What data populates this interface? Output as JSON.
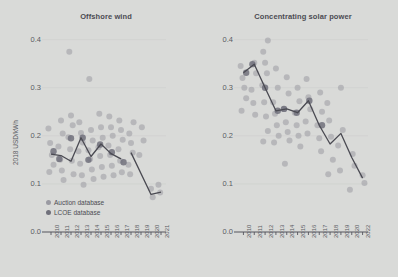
{
  "figure": {
    "background_color": "#d9dad8",
    "y_axis_label": "2018 USD/kWh",
    "y_ticks": [
      "0.0",
      "0.1",
      "0.2",
      "0.3",
      "0.4"
    ],
    "y_tick_values": [
      0.0,
      0.1,
      0.2,
      0.3,
      0.4
    ],
    "text_color": "#5a5a63",
    "line_color": "#4a4a52",
    "auction_color": "#9a9aa2",
    "lcoe_color": "#70707b"
  },
  "legend": {
    "position": "bottom-left-of-first-panel",
    "items": [
      {
        "label": "Auction database",
        "color": "#9a9aa2",
        "name": "auction"
      },
      {
        "label": "LCOE database",
        "color": "#70707b",
        "name": "lcoe"
      }
    ]
  },
  "chart_data": [
    {
      "type": "scatter",
      "title": "Offshore wind",
      "xlabel": "",
      "ylabel": "2018 USD/kWh",
      "ylim": [
        0.0,
        0.42
      ],
      "grid": false,
      "categories": [
        "2010",
        "2011",
        "2012",
        "2013",
        "2014",
        "2015",
        "2016",
        "2017",
        "2018",
        "2019",
        "2020",
        "2021"
      ],
      "line_label": "Weighted average",
      "line_series": {
        "name": "Weighted average",
        "x": [
          "2010",
          "2011",
          "2012",
          "2013",
          "2014",
          "2015",
          "2016",
          "2017"
        ],
        "values": [
          0.162,
          0.159,
          0.147,
          0.196,
          0.157,
          0.183,
          0.163,
          0.152
        ]
      },
      "line_series_2": {
        "name": "Weighted average (auction)",
        "x": [
          "2018",
          "2020",
          "2021"
        ],
        "values": [
          0.165,
          0.078,
          0.083
        ]
      },
      "series": [
        {
          "name": "Auction database",
          "color": "#9a9aa2",
          "points": [
            {
              "x": "2010",
              "y": 0.215
            },
            {
              "x": "2010",
              "y": 0.185
            },
            {
              "x": "2010",
              "y": 0.16
            },
            {
              "x": "2010",
              "y": 0.14
            },
            {
              "x": "2010",
              "y": 0.125
            },
            {
              "x": "2011",
              "y": 0.232
            },
            {
              "x": "2011",
              "y": 0.205
            },
            {
              "x": "2011",
              "y": 0.178
            },
            {
              "x": "2011",
              "y": 0.15
            },
            {
              "x": "2011",
              "y": 0.128
            },
            {
              "x": "2011",
              "y": 0.108
            },
            {
              "x": "2012",
              "y": 0.375
            },
            {
              "x": "2012",
              "y": 0.242
            },
            {
              "x": "2012",
              "y": 0.222
            },
            {
              "x": "2012",
              "y": 0.197
            },
            {
              "x": "2012",
              "y": 0.172
            },
            {
              "x": "2012",
              "y": 0.148
            },
            {
              "x": "2012",
              "y": 0.12
            },
            {
              "x": "2013",
              "y": 0.228
            },
            {
              "x": "2013",
              "y": 0.206
            },
            {
              "x": "2013",
              "y": 0.186
            },
            {
              "x": "2013",
              "y": 0.168
            },
            {
              "x": "2013",
              "y": 0.142
            },
            {
              "x": "2013",
              "y": 0.118
            },
            {
              "x": "2013",
              "y": 0.098
            },
            {
              "x": "2014",
              "y": 0.318
            },
            {
              "x": "2014",
              "y": 0.212
            },
            {
              "x": "2014",
              "y": 0.19
            },
            {
              "x": "2014",
              "y": 0.17
            },
            {
              "x": "2014",
              "y": 0.152
            },
            {
              "x": "2014",
              "y": 0.13
            },
            {
              "x": "2014",
              "y": 0.11
            },
            {
              "x": "2015",
              "y": 0.246
            },
            {
              "x": "2015",
              "y": 0.218
            },
            {
              "x": "2015",
              "y": 0.196
            },
            {
              "x": "2015",
              "y": 0.176
            },
            {
              "x": "2015",
              "y": 0.158
            },
            {
              "x": "2015",
              "y": 0.135
            },
            {
              "x": "2015",
              "y": 0.115
            },
            {
              "x": "2016",
              "y": 0.24
            },
            {
              "x": "2016",
              "y": 0.218
            },
            {
              "x": "2016",
              "y": 0.2
            },
            {
              "x": "2016",
              "y": 0.18
            },
            {
              "x": "2016",
              "y": 0.16
            },
            {
              "x": "2016",
              "y": 0.138
            },
            {
              "x": "2016",
              "y": 0.118
            },
            {
              "x": "2017",
              "y": 0.232
            },
            {
              "x": "2017",
              "y": 0.212
            },
            {
              "x": "2017",
              "y": 0.192
            },
            {
              "x": "2017",
              "y": 0.172
            },
            {
              "x": "2017",
              "y": 0.148
            },
            {
              "x": "2017",
              "y": 0.124
            },
            {
              "x": "2018",
              "y": 0.228
            },
            {
              "x": "2018",
              "y": 0.205
            },
            {
              "x": "2018",
              "y": 0.185
            },
            {
              "x": "2018",
              "y": 0.165
            },
            {
              "x": "2018",
              "y": 0.14
            },
            {
              "x": "2018",
              "y": 0.12
            },
            {
              "x": "2019",
              "y": 0.218
            },
            {
              "x": "2019",
              "y": 0.19
            },
            {
              "x": "2019",
              "y": 0.16
            },
            {
              "x": "2020",
              "y": 0.09
            },
            {
              "x": "2020",
              "y": 0.072
            },
            {
              "x": "2021",
              "y": 0.098
            },
            {
              "x": "2021",
              "y": 0.082
            }
          ]
        },
        {
          "name": "LCOE database",
          "color": "#70707b",
          "points": [
            {
              "x": "2010",
              "y": 0.168
            },
            {
              "x": "2011",
              "y": 0.152
            },
            {
              "x": "2012",
              "y": 0.195
            },
            {
              "x": "2013",
              "y": 0.196
            },
            {
              "x": "2014",
              "y": 0.15
            },
            {
              "x": "2015",
              "y": 0.182
            },
            {
              "x": "2016",
              "y": 0.166
            },
            {
              "x": "2017",
              "y": 0.145
            }
          ]
        }
      ]
    },
    {
      "type": "scatter",
      "title": "Concentrating solar power",
      "xlabel": "",
      "ylabel": "2018 USD/kWh",
      "ylim": [
        0.0,
        0.42
      ],
      "grid": false,
      "categories": [
        "2010",
        "2011",
        "2012",
        "2013",
        "2014",
        "2015",
        "2016",
        "2017",
        "2018",
        "2019",
        "2020",
        "2022"
      ],
      "line_label": "Weighted average",
      "line_series": {
        "name": "Weighted average",
        "x": [
          "2010",
          "2011",
          "2012",
          "2013",
          "2014",
          "2015",
          "2016",
          "2017",
          "2018",
          "2019",
          "2020",
          "2022"
        ],
        "values": [
          0.331,
          0.349,
          0.3,
          0.252,
          0.256,
          0.248,
          0.273,
          0.222,
          0.183,
          0.205,
          0.155,
          0.112
        ]
      },
      "series": [
        {
          "name": "Auction database",
          "color": "#9a9aa2",
          "points": [
            {
              "x": "2010",
              "y": 0.345
            },
            {
              "x": "2010",
              "y": 0.32
            },
            {
              "x": "2010",
              "y": 0.3
            },
            {
              "x": "2010",
              "y": 0.278
            },
            {
              "x": "2010",
              "y": 0.252
            },
            {
              "x": "2011",
              "y": 0.352
            },
            {
              "x": "2011",
              "y": 0.33
            },
            {
              "x": "2011",
              "y": 0.296
            },
            {
              "x": "2011",
              "y": 0.268
            },
            {
              "x": "2011",
              "y": 0.244
            },
            {
              "x": "2012",
              "y": 0.398
            },
            {
              "x": "2012",
              "y": 0.375
            },
            {
              "x": "2012",
              "y": 0.352
            },
            {
              "x": "2012",
              "y": 0.33
            },
            {
              "x": "2012",
              "y": 0.305
            },
            {
              "x": "2012",
              "y": 0.27
            },
            {
              "x": "2012",
              "y": 0.24
            },
            {
              "x": "2012",
              "y": 0.21
            },
            {
              "x": "2012",
              "y": 0.188
            },
            {
              "x": "2013",
              "y": 0.34
            },
            {
              "x": "2013",
              "y": 0.3
            },
            {
              "x": "2013",
              "y": 0.27
            },
            {
              "x": "2013",
              "y": 0.246
            },
            {
              "x": "2013",
              "y": 0.222
            },
            {
              "x": "2013",
              "y": 0.2
            },
            {
              "x": "2013",
              "y": 0.186
            },
            {
              "x": "2014",
              "y": 0.322
            },
            {
              "x": "2014",
              "y": 0.288
            },
            {
              "x": "2014",
              "y": 0.256
            },
            {
              "x": "2014",
              "y": 0.228
            },
            {
              "x": "2014",
              "y": 0.208
            },
            {
              "x": "2014",
              "y": 0.19
            },
            {
              "x": "2014",
              "y": 0.142
            },
            {
              "x": "2015",
              "y": 0.3
            },
            {
              "x": "2015",
              "y": 0.272
            },
            {
              "x": "2015",
              "y": 0.248
            },
            {
              "x": "2015",
              "y": 0.222
            },
            {
              "x": "2015",
              "y": 0.2
            },
            {
              "x": "2015",
              "y": 0.178
            },
            {
              "x": "2016",
              "y": 0.318
            },
            {
              "x": "2016",
              "y": 0.28
            },
            {
              "x": "2016",
              "y": 0.255
            },
            {
              "x": "2016",
              "y": 0.23
            },
            {
              "x": "2016",
              "y": 0.205
            },
            {
              "x": "2017",
              "y": 0.29
            },
            {
              "x": "2017",
              "y": 0.25
            },
            {
              "x": "2017",
              "y": 0.222
            },
            {
              "x": "2017",
              "y": 0.195
            },
            {
              "x": "2017",
              "y": 0.168
            },
            {
              "x": "2018",
              "y": 0.268
            },
            {
              "x": "2018",
              "y": 0.232
            },
            {
              "x": "2018",
              "y": 0.198
            },
            {
              "x": "2018",
              "y": 0.15
            },
            {
              "x": "2018",
              "y": 0.12
            },
            {
              "x": "2019",
              "y": 0.3
            },
            {
              "x": "2019",
              "y": 0.212
            },
            {
              "x": "2019",
              "y": 0.18
            },
            {
              "x": "2019",
              "y": 0.128
            },
            {
              "x": "2020",
              "y": 0.162
            },
            {
              "x": "2020",
              "y": 0.138
            },
            {
              "x": "2020",
              "y": 0.088
            },
            {
              "x": "2022",
              "y": 0.118
            },
            {
              "x": "2022",
              "y": 0.102
            }
          ]
        },
        {
          "name": "LCOE database",
          "color": "#70707b",
          "points": [
            {
              "x": "2010",
              "y": 0.331
            },
            {
              "x": "2011",
              "y": 0.349
            },
            {
              "x": "2012",
              "y": 0.3
            },
            {
              "x": "2013",
              "y": 0.252
            },
            {
              "x": "2014",
              "y": 0.256
            },
            {
              "x": "2015",
              "y": 0.248
            },
            {
              "x": "2016",
              "y": 0.273
            },
            {
              "x": "2017",
              "y": 0.222
            }
          ]
        }
      ]
    }
  ]
}
